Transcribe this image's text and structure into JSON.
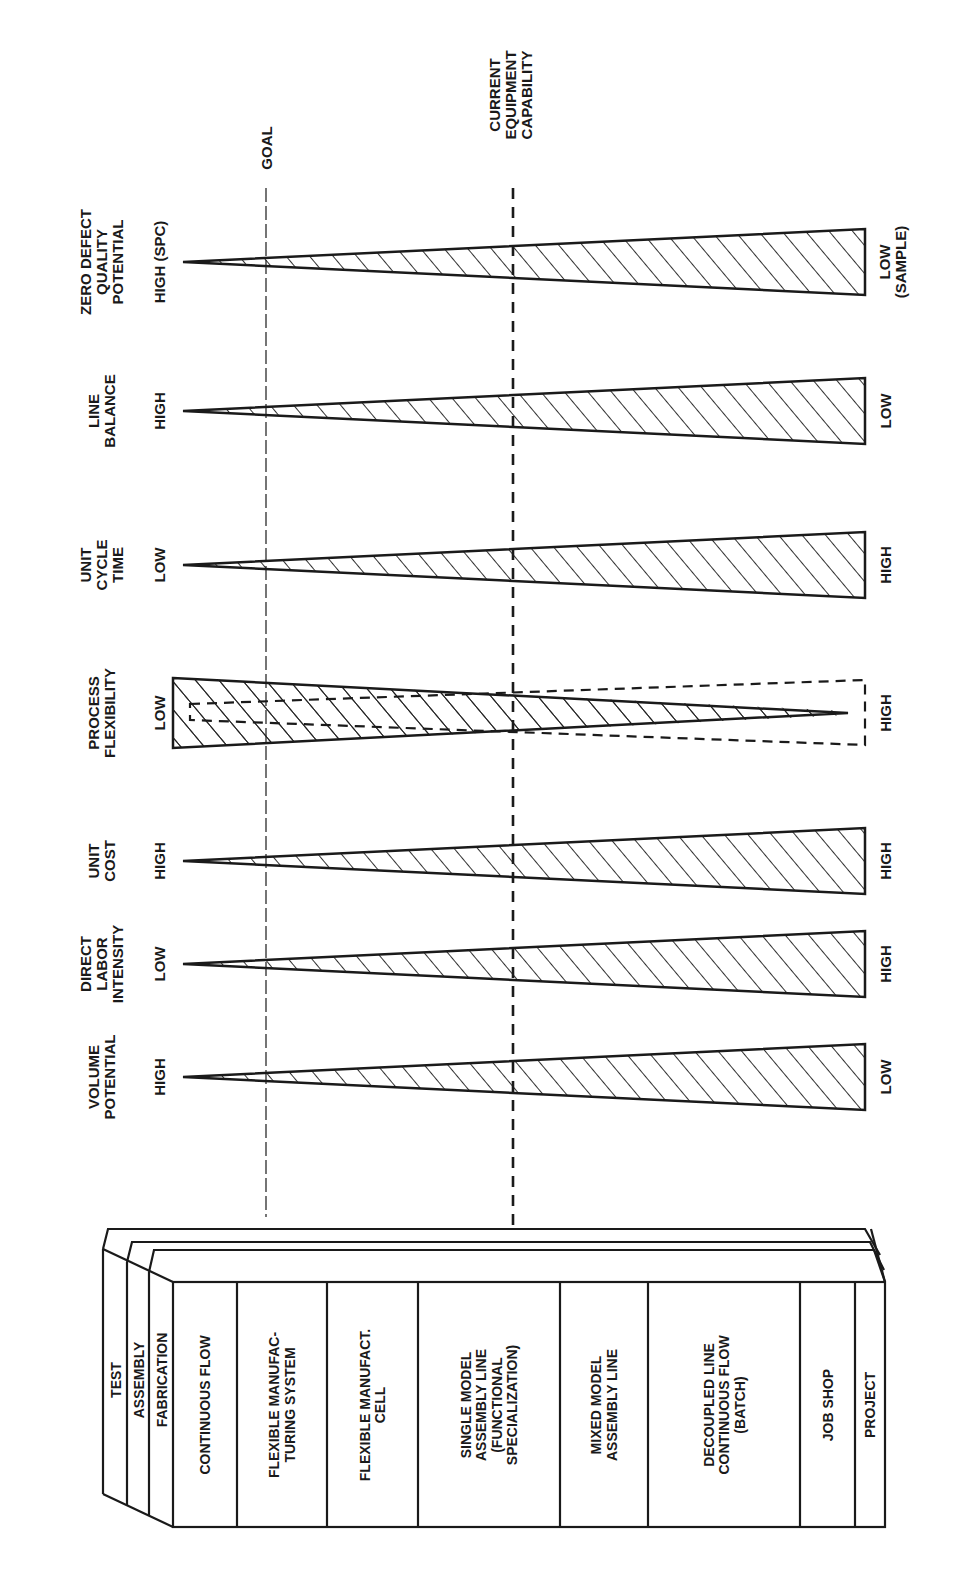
{
  "orientation": "rotated-90-ccw",
  "reference_lines": {
    "goal": {
      "label": "GOAL",
      "style": "thin-dashed"
    },
    "current": {
      "label_lines": [
        "CURRENT",
        "EQUIPMENT",
        "CAPABILITY"
      ],
      "style": "heavy-dashed"
    }
  },
  "metrics": [
    {
      "id": "volume-potential",
      "title_lines": [
        "VOLUME",
        "POTENTIAL"
      ],
      "start_label": "HIGH",
      "end_label_lines": [
        "LOW"
      ],
      "shape": "widening"
    },
    {
      "id": "direct-labor-intensity",
      "title_lines": [
        "DIRECT",
        "LABOR",
        "INTENSITY"
      ],
      "start_label": "LOW",
      "end_label_lines": [
        "HIGH"
      ],
      "shape": "widening"
    },
    {
      "id": "unit-cost",
      "title_lines": [
        "UNIT",
        "COST"
      ],
      "start_label": "HIGH",
      "end_label_lines": [
        "HIGH"
      ],
      "shape": "widening"
    },
    {
      "id": "process-flexibility",
      "title_lines": [
        "PROCESS",
        "FLEXIBILITY"
      ],
      "start_label": "LOW",
      "end_label_lines": [
        "HIGH"
      ],
      "shape": "narrowing-with-dashed-outline"
    },
    {
      "id": "unit-cycle-time",
      "title_lines": [
        "UNIT",
        "CYCLE",
        "TIME"
      ],
      "start_label": "LOW",
      "end_label_lines": [
        "HIGH"
      ],
      "shape": "widening"
    },
    {
      "id": "line-balance",
      "title_lines": [
        "LINE",
        "BALANCE"
      ],
      "start_label": "HIGH",
      "end_label_lines": [
        "LOW"
      ],
      "shape": "widening"
    },
    {
      "id": "zero-defect-quality-potential",
      "title_lines": [
        "ZERO DEFECT",
        "QUALITY",
        "POTENTIAL"
      ],
      "start_label": "HIGH (SPC)",
      "end_label_lines": [
        "LOW",
        "(SAMPLE)"
      ],
      "shape": "widening"
    }
  ],
  "box": {
    "layers": [
      "TEST",
      "ASSEMBLY",
      "FABRICATION"
    ],
    "columns": [
      {
        "lines": [
          "CONTINUOUS FLOW"
        ]
      },
      {
        "lines": [
          "FLEXIBLE MANUFAC-",
          "TURING SYSTEM"
        ]
      },
      {
        "lines": [
          "FLEXIBLE MANUFACT.",
          "CELL"
        ]
      },
      {
        "lines": [
          "SINGLE MODEL",
          "ASSEMBLY LINE",
          "(FUNCTIONAL",
          "SPECIALIZATION)"
        ]
      },
      {
        "lines": [
          "MIXED MODEL",
          "ASSEMBLY LINE"
        ]
      },
      {
        "lines": [
          "DECOUPLED LINE",
          "CONTINUOUS FLOW",
          "(BATCH)"
        ]
      },
      {
        "lines": [
          "JOB SHOP"
        ]
      },
      {
        "lines": [
          "PROJECT"
        ]
      }
    ]
  }
}
